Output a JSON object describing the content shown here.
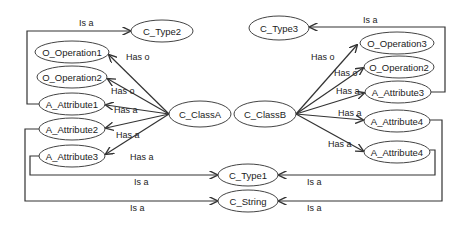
{
  "diagram": {
    "type": "class-relationship-graph",
    "nodes": [
      {
        "id": "c_type2",
        "label": "C_Type2",
        "cx": 162,
        "cy": 31,
        "rx": 31,
        "ry": 11
      },
      {
        "id": "o_operation1_a",
        "label": "O_Operation1",
        "cx": 72,
        "cy": 52,
        "rx": 37,
        "ry": 11
      },
      {
        "id": "o_operation2_a",
        "label": "O_Operation2",
        "cx": 72,
        "cy": 77,
        "rx": 35,
        "ry": 11
      },
      {
        "id": "a_attribute1",
        "label": "A_Attribute1",
        "cx": 72,
        "cy": 104,
        "rx": 33,
        "ry": 11
      },
      {
        "id": "a_attribute2",
        "label": "A_Attribute2",
        "cx": 72,
        "cy": 129,
        "rx": 33,
        "ry": 11
      },
      {
        "id": "a_attribute3_a",
        "label": "A_Attribute3",
        "cx": 72,
        "cy": 156,
        "rx": 33,
        "ry": 11
      },
      {
        "id": "c_classa",
        "label": "C_ClassA",
        "cx": 200,
        "cy": 114,
        "rx": 31,
        "ry": 13
      },
      {
        "id": "c_classb",
        "label": "C_ClassB",
        "cx": 265,
        "cy": 114,
        "rx": 31,
        "ry": 13
      },
      {
        "id": "c_type1",
        "label": "C_Type1",
        "cx": 248,
        "cy": 175,
        "rx": 30,
        "ry": 11
      },
      {
        "id": "c_string",
        "label": "C_String",
        "cx": 248,
        "cy": 201,
        "rx": 30,
        "ry": 11
      },
      {
        "id": "c_type3",
        "label": "C_Type3",
        "cx": 279,
        "cy": 28,
        "rx": 30,
        "ry": 12
      },
      {
        "id": "o_operation3",
        "label": "O_Operation3",
        "cx": 397,
        "cy": 43,
        "rx": 37,
        "ry": 11
      },
      {
        "id": "o_operation2_b",
        "label": "O_Operation2",
        "cx": 399,
        "cy": 67,
        "rx": 35,
        "ry": 11
      },
      {
        "id": "a_attribute3_b",
        "label": "A_Attribute3",
        "cx": 398,
        "cy": 92,
        "rx": 33,
        "ry": 11
      },
      {
        "id": "a_attribute4_1",
        "label": "A_Attribute4",
        "cx": 397,
        "cy": 121,
        "rx": 33,
        "ry": 11
      },
      {
        "id": "a_attribute4_2",
        "label": "A_Attribute4",
        "cx": 397,
        "cy": 152,
        "rx": 33,
        "ry": 11
      }
    ],
    "edges": [
      {
        "from": "c_classa",
        "to": "o_operation1_a",
        "label": "Has o"
      },
      {
        "from": "c_classa",
        "to": "o_operation2_a",
        "label": "Has o"
      },
      {
        "from": "c_classa",
        "to": "a_attribute1",
        "label": "Has a"
      },
      {
        "from": "c_classa",
        "to": "a_attribute2",
        "label": "Has a"
      },
      {
        "from": "c_classa",
        "to": "a_attribute3_a",
        "label": "Has a"
      },
      {
        "from": "a_attribute1",
        "to": "c_type2",
        "label": "Is a"
      },
      {
        "from": "a_attribute3_a",
        "to": "c_type1",
        "label": "Is a"
      },
      {
        "from": "a_attribute2",
        "to": "c_string",
        "label": "Is a"
      },
      {
        "from": "c_classb",
        "to": "o_operation3",
        "label": "Has o"
      },
      {
        "from": "c_classb",
        "to": "o_operation2_b",
        "label": "Has o"
      },
      {
        "from": "c_classb",
        "to": "a_attribute3_b",
        "label": "Has a"
      },
      {
        "from": "c_classb",
        "to": "a_attribute4_1",
        "label": "Has a"
      },
      {
        "from": "c_classb",
        "to": "a_attribute4_2",
        "label": "Has a"
      },
      {
        "from": "a_attribute3_b",
        "to": "c_type3",
        "label": "Is a"
      },
      {
        "from": "a_attribute4_2",
        "to": "c_type1",
        "label": "Is a"
      },
      {
        "from": "a_attribute4_1",
        "to": "c_string",
        "label": "Is a"
      }
    ],
    "labels": {
      "is_a": "Is a",
      "has_o": "Has o",
      "has_a": "Has a"
    }
  }
}
